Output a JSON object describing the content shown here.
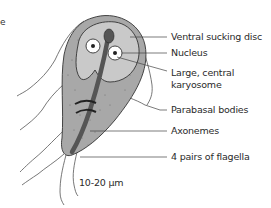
{
  "diagram": {
    "labels": {
      "ventral_sucking_disc": "Ventral sucking disc",
      "nucleus": "Nucleus",
      "karyosome_line1": "Large, central",
      "karyosome_line2": "karyosome",
      "parabasal_bodies": "Parabasal bodies",
      "axonemes": "Axonemes",
      "flagella": "4 pairs of flagella",
      "scale": "10-20 µm"
    },
    "edge_fragment": "e",
    "colors": {
      "body_fill": "#a8a8a8",
      "disc_fill": "#c9c9c9",
      "axostyle": "#555555",
      "outline": "#333333",
      "nucleus_fill": "#ffffff",
      "karyosome": "#222222",
      "leader_line": "#444444"
    }
  }
}
